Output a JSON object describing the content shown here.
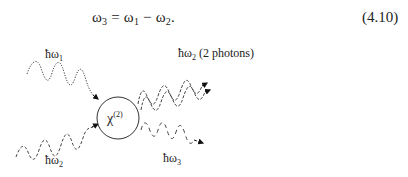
{
  "equation": {
    "lhs": "ω",
    "lhs_sub": "3",
    "eq": " = ",
    "t1": "ω",
    "t1_sub": "1",
    "minus": " − ",
    "t2": "ω",
    "t2_sub": "2",
    "end": ".",
    "number": "(4.10)"
  },
  "diagram": {
    "center_label": "χ",
    "center_label_sup": "(2)",
    "inputs": [
      {
        "label": "ħω",
        "sub": "1"
      },
      {
        "label": "ħω",
        "sub": "2"
      }
    ],
    "outputs": [
      {
        "label": "ħω",
        "sub": "2",
        "note": " (2 photons)"
      },
      {
        "label": "ħω",
        "sub": "3"
      }
    ]
  }
}
